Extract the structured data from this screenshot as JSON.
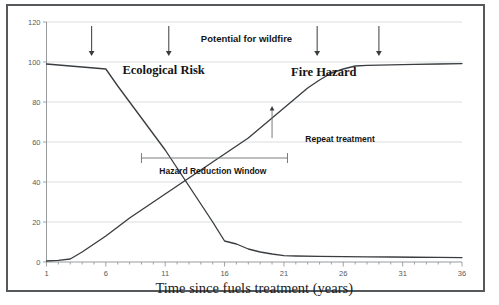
{
  "figure": {
    "has_outer_border": true,
    "background_color": "#ffffff",
    "line_color": "#3a3d40"
  },
  "chart_data": {
    "type": "line",
    "title": "",
    "xlabel": "Time since fuels treatment  (years)",
    "ylabel": "",
    "xlim": [
      1,
      36
    ],
    "ylim": [
      0,
      120
    ],
    "xticks": [
      1,
      6,
      11,
      16,
      21,
      26,
      31,
      36
    ],
    "yticks": [
      0,
      20,
      40,
      60,
      80,
      100,
      120
    ],
    "xtick_labels": [
      "1",
      "6",
      "11",
      "16",
      "21",
      "26",
      "31",
      "36"
    ],
    "ytick_labels": [
      "0",
      "20",
      "40",
      "60",
      "80",
      "100",
      "120"
    ],
    "grid": true,
    "grid_axis": "y",
    "legend_position": "inline-labels",
    "series": [
      {
        "name": "Ecological Risk",
        "label_position": "upper-left",
        "x": [
          1,
          2,
          3,
          4,
          5,
          6,
          7,
          8,
          9,
          10,
          11,
          12,
          13,
          14,
          15,
          16,
          17,
          18,
          19,
          20,
          21,
          22,
          24,
          26,
          28,
          30,
          32,
          34,
          36
        ],
        "values": [
          99,
          98.5,
          98,
          97.5,
          97,
          96.5,
          88,
          80,
          72,
          64,
          56,
          47,
          38,
          29,
          20,
          10.5,
          9,
          6.5,
          5,
          4,
          3.2,
          3,
          2.8,
          2.7,
          2.6,
          2.5,
          2.4,
          2.3,
          2.2
        ]
      },
      {
        "name": "Fire Hazard",
        "label_position": "upper-right",
        "x": [
          1,
          2,
          3,
          4,
          5,
          6,
          7,
          8,
          9,
          10,
          11,
          12,
          13,
          14,
          15,
          16,
          17,
          18,
          19,
          20,
          21,
          22,
          23,
          24,
          25,
          26,
          27,
          28,
          30,
          32,
          34,
          36
        ],
        "values": [
          0.5,
          0.8,
          1.5,
          5,
          9,
          13,
          17.5,
          22,
          26,
          30,
          34,
          38,
          42,
          46,
          50,
          54,
          58,
          62,
          67,
          72,
          77,
          82,
          87,
          91,
          94.5,
          96.5,
          98,
          98.3,
          98.6,
          98.8,
          99,
          99.2
        ]
      }
    ],
    "annotations": [
      {
        "id": "potential-for-wildfire",
        "text": "Potential  for  wildfire",
        "style": "sans-bold",
        "x_data": 14.0,
        "y_data": 110
      },
      {
        "id": "ecological-risk-label",
        "text": "Ecological Risk",
        "style": "serif-bold",
        "x_data": 7.4,
        "y_data": 94
      },
      {
        "id": "fire-hazard-label",
        "text": "Fire Hazard",
        "style": "serif-bold",
        "x_data": 21.6,
        "y_data": 93
      },
      {
        "id": "repeat-treatment-label",
        "text": "Repeat treatment",
        "style": "sans-bold",
        "x_data": 22.8,
        "y_data": 60
      },
      {
        "id": "hazard-reduction-window-label",
        "text": "Hazard  Reduction  Window",
        "style": "sans-bold",
        "x_data": 10.5,
        "y_data": 44
      }
    ],
    "treatment_arrows": {
      "description": "Downward arrows marking treatment entries",
      "x_data": [
        4.8,
        11.3,
        23.8,
        29.0
      ],
      "y_top": 118,
      "y_bottom": 103,
      "count": 4
    },
    "repeat_treatment_marker": {
      "x_data": 20.0,
      "y_arrow_tip": 78,
      "y_base": 62
    },
    "hazard_reduction_window_bar": {
      "x_start_data": 9.0,
      "x_end_data": 21.3,
      "y_data": 52
    }
  }
}
